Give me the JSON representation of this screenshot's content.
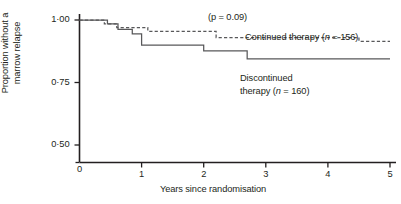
{
  "chart_data": {
    "type": "line",
    "subtype": "kaplan-meier-step",
    "title": "",
    "xlabel": "Years since randomisation",
    "ylabel": "Proportion without a marrow relapse",
    "ylabel_lines": [
      "Proportion without a",
      "marrow relapse"
    ],
    "xlim": [
      0,
      5
    ],
    "ylim": [
      0.5,
      1.0
    ],
    "y_axis_broken_at_zero": true,
    "grid": false,
    "legend_position": "inline-annotations",
    "xticks": [
      0,
      1,
      2,
      3,
      4,
      5
    ],
    "xtick_labels": [
      "0",
      "1",
      "2",
      "3",
      "4",
      "5"
    ],
    "yticks": [
      0.5,
      0.75,
      1.0
    ],
    "ytick_labels": [
      "0·50",
      "0·75",
      "1·00"
    ],
    "annotations": [
      {
        "text": "(p = 0.09)",
        "x": 2.45,
        "y": 1.0
      }
    ],
    "pvalue": "0.09",
    "series": [
      {
        "name": "Continued therapy",
        "n": 156,
        "label": "Continued therapy (n = 156)",
        "style": "dashed",
        "color": "#58585a",
        "x": [
          0.0,
          0.4,
          0.6,
          1.1,
          2.2,
          4.5,
          5.0
        ],
        "y": [
          1.0,
          0.985,
          0.97,
          0.955,
          0.93,
          0.915,
          0.915
        ]
      },
      {
        "name": "Discontinued therapy",
        "n": 160,
        "label": "Discontinued therapy (n = 160)",
        "label_lines": [
          "Discontinued",
          "therapy (n = 160)"
        ],
        "style": "solid",
        "color": "#58585a",
        "x": [
          0.0,
          0.45,
          0.62,
          0.85,
          1.0,
          2.0,
          2.7,
          5.0
        ],
        "y": [
          1.0,
          0.985,
          0.963,
          0.945,
          0.9,
          0.877,
          0.845,
          0.845
        ]
      }
    ]
  },
  "labels": {
    "pvalue_annotation": "(p = 0.09)",
    "continued_prefix": "Continued therapy (",
    "continued_italic": "n",
    "continued_suffix": " = 156)",
    "discontinued_line1": "Discontinued",
    "discontinued_prefix": "therapy (",
    "discontinued_italic": "n",
    "discontinued_suffix": " = 160)",
    "ytitle_line1": "Proportion without a",
    "ytitle_line2": "marrow relapse",
    "xtitle": "Years since randomisation"
  },
  "colors": {
    "axis": "#231f20",
    "curve": "#58585a",
    "background": "#ffffff",
    "text": "#231f20"
  }
}
